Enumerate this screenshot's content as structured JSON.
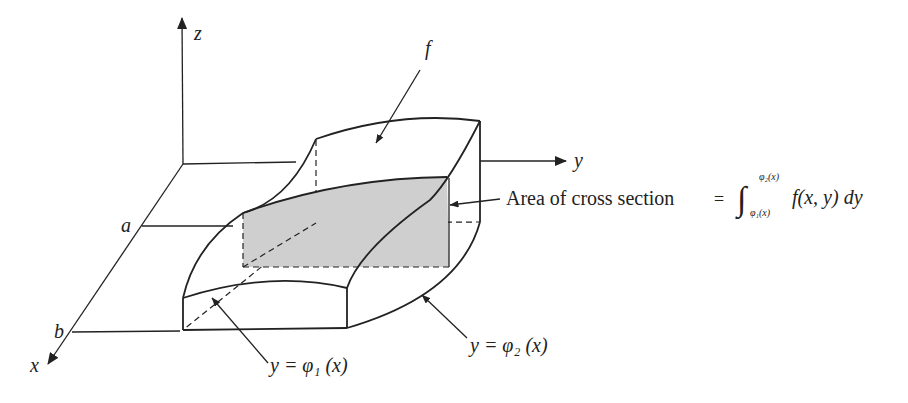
{
  "diagram": {
    "type": "3d-region-iterated-integral",
    "axes": {
      "x_label": "x",
      "y_label": "y",
      "z_label": "z"
    },
    "bounds": {
      "a_label": "a",
      "b_label": "b"
    },
    "surface_label": "f",
    "cross_section": {
      "caption": "Area of cross section",
      "equals": "=",
      "integral_sign": "∫",
      "upper_limit": "φ₂(x)",
      "lower_limit": "φ₁(x)",
      "integrand": "f(x, y) dy",
      "fill_color": "#cfcfcf"
    },
    "curve_labels": {
      "phi1": "y = φ₁ (x)",
      "phi2": "y = φ₂ (x)"
    },
    "line_color": "#222222"
  }
}
